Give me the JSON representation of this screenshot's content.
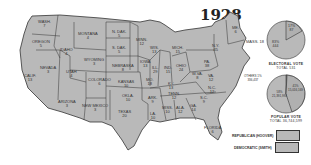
{
  "title": "1928",
  "colors": {
    "state_fill": "#b9b9b9",
    "border": "#333333",
    "background": "#ffffff"
  },
  "states": [
    {
      "name": "WASH.",
      "ev": "7"
    },
    {
      "name": "OREGON",
      "ev": "5"
    },
    {
      "name": "CALIF.",
      "ev": "13"
    },
    {
      "name": "NEVADA",
      "ev": "3"
    },
    {
      "name": "IDAHO",
      "ev": "4"
    },
    {
      "name": "MONTANA",
      "ev": "4"
    },
    {
      "name": "WYOMING",
      "ev": "3"
    },
    {
      "name": "UTAH",
      "ev": "4"
    },
    {
      "name": "ARIZONA",
      "ev": "3"
    },
    {
      "name": "COLORADO",
      "ev": "6"
    },
    {
      "name": "NEW MEXICO",
      "ev": "3"
    },
    {
      "name": "N. DAK.",
      "ev": "5"
    },
    {
      "name": "S. DAK.",
      "ev": "5"
    },
    {
      "name": "NEBRASKA",
      "ev": "8"
    },
    {
      "name": "KANSAS",
      "ev": "10"
    },
    {
      "name": "OKLA.",
      "ev": "10"
    },
    {
      "name": "TEXAS",
      "ev": "20"
    },
    {
      "name": "MINN.",
      "ev": "12"
    },
    {
      "name": "IOWA",
      "ev": "13"
    },
    {
      "name": "MO.",
      "ev": "18"
    },
    {
      "name": "ARK.",
      "ev": "9"
    },
    {
      "name": "LA.",
      "ev": "10"
    },
    {
      "name": "WIS.",
      "ev": "13"
    },
    {
      "name": "ILL.",
      "ev": "29"
    },
    {
      "name": "MICH.",
      "ev": "15"
    },
    {
      "name": "IND.",
      "ev": "15"
    },
    {
      "name": "OHIO",
      "ev": "24"
    },
    {
      "name": "KY.",
      "ev": "13"
    },
    {
      "name": "TENN.",
      "ev": "12"
    },
    {
      "name": "MISS.",
      "ev": "10"
    },
    {
      "name": "ALA.",
      "ev": "12"
    },
    {
      "name": "GA.",
      "ev": "14"
    },
    {
      "name": "FLORIDA",
      "ev": "6"
    },
    {
      "name": "S.C.",
      "ev": "9"
    },
    {
      "name": "N.C.",
      "ev": "12"
    },
    {
      "name": "VA.",
      "ev": "12"
    },
    {
      "name": "W.VA.",
      "ev": "8"
    },
    {
      "name": "PA.",
      "ev": "38"
    },
    {
      "name": "N.Y.",
      "ev": "45"
    },
    {
      "name": "ME.",
      "ev": "6"
    },
    {
      "name": "MASS.",
      "ev": "18"
    }
  ],
  "electoral_pie": {
    "caption": "ELECTORAL VOTE",
    "total": "TOTAL 531",
    "republican": {
      "pct": "83%",
      "votes": "444"
    },
    "democratic": {
      "pct": "17%",
      "votes": "87"
    }
  },
  "popular_pie": {
    "caption": "POPULAR VOTE",
    "total": "TOTAL 36,744,599",
    "republican": {
      "pct": "58%",
      "votes": "21,391,993"
    },
    "democratic": {
      "pct": "41%",
      "votes": "15,016,169"
    },
    "others": {
      "pct": "1%",
      "votes": "336,437",
      "label": "OTHERS"
    }
  },
  "legend": [
    {
      "label": "REPUBLICAN (HOOVER)"
    },
    {
      "label": "DEMOCRATIC (SMITH)"
    }
  ]
}
